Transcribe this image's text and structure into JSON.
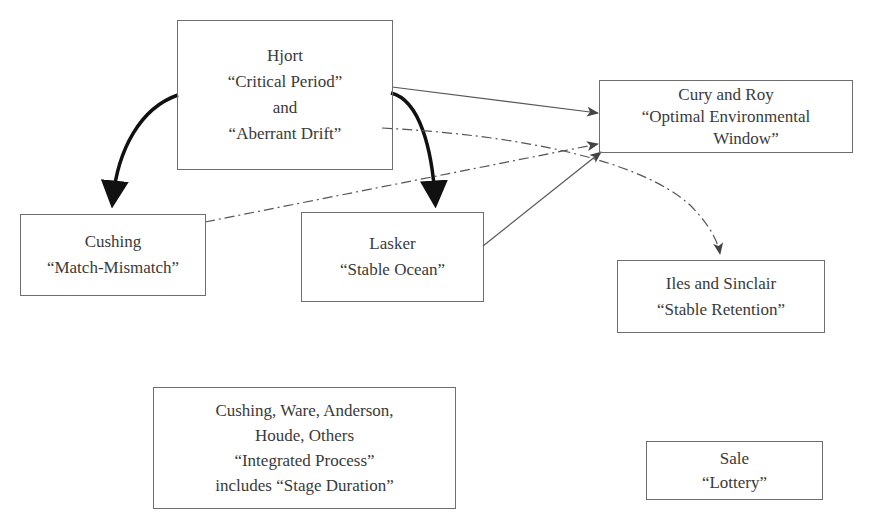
{
  "diagram": {
    "nodes": {
      "hjort": {
        "lines": [
          "Hjort",
          "“Critical Period”",
          "and",
          "“Aberrant Drift”"
        ]
      },
      "cury_roy": {
        "lines": [
          "Cury and Roy",
          "“Optimal Environmental",
          "Window”"
        ]
      },
      "cushing": {
        "lines": [
          "Cushing",
          "“Match-Mismatch”"
        ]
      },
      "lasker": {
        "lines": [
          "Lasker",
          "“Stable Ocean”"
        ]
      },
      "iles_sinclair": {
        "lines": [
          "Iles and Sinclair",
          "“Stable Retention”"
        ]
      },
      "integrated": {
        "lines": [
          "Cushing, Ware, Anderson,",
          "Houde, Others",
          "“Integrated Process”",
          "includes “Stage Duration”"
        ]
      },
      "sale": {
        "lines": [
          "Sale",
          "“Lottery”"
        ]
      }
    },
    "edges": [
      {
        "from": "Hjort",
        "to": "Cushing",
        "style": "thick-solid-curved"
      },
      {
        "from": "Hjort",
        "to": "Lasker",
        "style": "thick-solid-curved"
      },
      {
        "from": "Hjort",
        "to": "Cury and Roy",
        "style": "thin-solid"
      },
      {
        "from": "Hjort",
        "to": "Iles and Sinclair",
        "style": "dash-dot-curved"
      },
      {
        "from": "Cushing",
        "to": "Cury and Roy",
        "style": "dash-dot"
      },
      {
        "from": "Lasker",
        "to": "Cury and Roy",
        "style": "thin-solid"
      }
    ],
    "colors": {
      "border": "#6e6e6e",
      "text": "#3a3a3a",
      "thick_arrow": "#111111",
      "thin_arrow": "#555555"
    }
  }
}
